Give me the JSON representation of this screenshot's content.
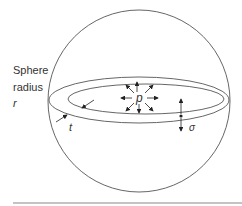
{
  "labels": {
    "sphere_line1": "Sphere",
    "sphere_line2": "radius",
    "sphere_var": "r",
    "pressure": "p",
    "thickness": "t",
    "stress": "σ"
  },
  "colors": {
    "stroke": "#555555",
    "text": "#333333",
    "rule": "#888888"
  }
}
